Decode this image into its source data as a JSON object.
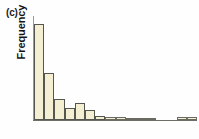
{
  "figure": {
    "panel_label": "(c)",
    "ylabel": "Frequency",
    "xlabel": "",
    "title": ""
  },
  "colors": {
    "bar_fill": "#f4efd2",
    "bar_stroke": "#565650",
    "axis": "#6e6e66",
    "background": "#fefefe",
    "text": "#141414"
  },
  "chart_data": {
    "type": "bar",
    "title": "",
    "xlabel": "",
    "ylabel": "Frequency",
    "grid": false,
    "legend": null,
    "axis_ticks_shown": false,
    "ylim": [
      0,
      100
    ],
    "categories": [
      "1",
      "2",
      "3",
      "4",
      "5",
      "6",
      "7",
      "8",
      "9",
      "10",
      "11",
      "12",
      "13",
      "14",
      "15",
      "16"
    ],
    "values": [
      92,
      45,
      20,
      12,
      16,
      10,
      4,
      3,
      3,
      2,
      2,
      2,
      0,
      0,
      3,
      3
    ],
    "bar_count": 16,
    "distribution_shape": "right-skewed",
    "note": "Histogram with long right tail; frequencies estimated from bar heights (axis unlabeled)."
  }
}
